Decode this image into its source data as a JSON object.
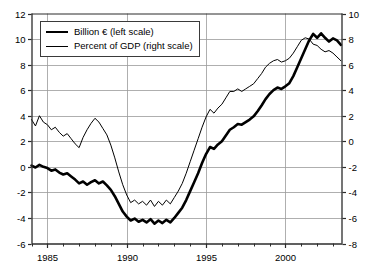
{
  "chart_data": {
    "type": "line",
    "title": "",
    "subtitle": "",
    "xlabel": "",
    "ylabel": "Billion €",
    "y2label": "Percent of GDP",
    "grid": true,
    "legend_position": "top-left",
    "xlim": [
      1984.0,
      2003.6
    ],
    "ylim": [
      -6,
      12
    ],
    "y2lim": [
      -8,
      10
    ],
    "yticks": [
      -6,
      -4,
      -2,
      0,
      2,
      4,
      6,
      8,
      10,
      12
    ],
    "y2ticks": [
      -8,
      -6,
      -4,
      -2,
      0,
      2,
      4,
      6,
      8,
      10
    ],
    "xticks_major": [
      1985,
      1990,
      1995,
      2000
    ],
    "xticks_minor": [
      1984,
      1986,
      1987,
      1988,
      1989,
      1991,
      1992,
      1993,
      1994,
      1996,
      1997,
      1998,
      1999,
      2001,
      2002,
      2003
    ],
    "ytick_labels": [
      "-6",
      "-4",
      "-2",
      "0",
      "2",
      "4",
      "6",
      "8",
      "10",
      "12"
    ],
    "y2tick_labels": [
      "-8",
      "-6",
      "-4",
      "-2",
      "0",
      "2",
      "4",
      "6",
      "8",
      "10"
    ],
    "xtick_labels": [
      "1985",
      "1990",
      "1995",
      "2000"
    ],
    "series": [
      {
        "name": "Billion € (left scale)",
        "axis": "left",
        "style": "thick",
        "color": "#000000",
        "width": 2.6,
        "x": [
          1984.0,
          1984.25,
          1984.5,
          1984.75,
          1985.0,
          1985.25,
          1985.5,
          1985.75,
          1986.0,
          1986.25,
          1986.5,
          1986.75,
          1987.0,
          1987.25,
          1987.5,
          1987.75,
          1988.0,
          1988.25,
          1988.5,
          1988.75,
          1989.0,
          1989.25,
          1989.5,
          1989.75,
          1990.0,
          1990.25,
          1990.5,
          1990.75,
          1991.0,
          1991.25,
          1991.5,
          1991.75,
          1992.0,
          1992.25,
          1992.5,
          1992.75,
          1993.0,
          1993.25,
          1993.5,
          1993.75,
          1994.0,
          1994.25,
          1994.5,
          1994.75,
          1995.0,
          1995.25,
          1995.5,
          1995.75,
          1996.0,
          1996.25,
          1996.5,
          1996.75,
          1997.0,
          1997.25,
          1997.5,
          1997.75,
          1998.0,
          1998.25,
          1998.5,
          1998.75,
          1999.0,
          1999.25,
          1999.5,
          1999.75,
          2000.0,
          2000.25,
          2000.5,
          2000.75,
          2001.0,
          2001.25,
          2001.5,
          2001.75,
          2002.0,
          2002.25,
          2002.5,
          2002.75,
          2003.0,
          2003.25,
          2003.5
        ],
        "values": [
          0.1,
          -0.05,
          0.15,
          0.0,
          -0.1,
          -0.3,
          -0.2,
          -0.45,
          -0.6,
          -0.5,
          -0.75,
          -1.0,
          -1.3,
          -1.15,
          -1.4,
          -1.2,
          -1.05,
          -1.3,
          -1.15,
          -1.45,
          -1.8,
          -2.3,
          -2.9,
          -3.5,
          -3.9,
          -4.2,
          -4.05,
          -4.3,
          -4.15,
          -4.35,
          -4.1,
          -4.45,
          -4.2,
          -4.4,
          -4.15,
          -4.35,
          -4.0,
          -3.6,
          -3.2,
          -2.6,
          -1.9,
          -1.2,
          -0.5,
          0.3,
          1.0,
          1.55,
          1.4,
          1.75,
          2.0,
          2.45,
          2.9,
          3.1,
          3.35,
          3.3,
          3.5,
          3.7,
          3.95,
          4.35,
          4.8,
          5.3,
          5.7,
          6.0,
          6.2,
          6.1,
          6.3,
          6.55,
          7.1,
          7.8,
          8.5,
          9.2,
          9.9,
          10.4,
          10.1,
          10.45,
          10.1,
          9.8,
          10.05,
          9.9,
          9.55
        ]
      },
      {
        "name": "Percent of GDP (right scale)",
        "axis": "right",
        "style": "thin",
        "color": "#000000",
        "width": 1.0,
        "x": [
          1984.0,
          1984.25,
          1984.5,
          1984.75,
          1985.0,
          1985.25,
          1985.5,
          1985.75,
          1986.0,
          1986.25,
          1986.5,
          1986.75,
          1987.0,
          1987.25,
          1987.5,
          1987.75,
          1988.0,
          1988.25,
          1988.5,
          1988.75,
          1989.0,
          1989.25,
          1989.5,
          1989.75,
          1990.0,
          1990.25,
          1990.5,
          1990.75,
          1991.0,
          1991.25,
          1991.5,
          1991.75,
          1992.0,
          1992.25,
          1992.5,
          1992.75,
          1993.0,
          1993.25,
          1993.5,
          1993.75,
          1994.0,
          1994.25,
          1994.5,
          1994.75,
          1995.0,
          1995.25,
          1995.5,
          1995.75,
          1996.0,
          1996.25,
          1996.5,
          1996.75,
          1997.0,
          1997.25,
          1997.5,
          1997.75,
          1998.0,
          1998.25,
          1998.5,
          1998.75,
          1999.0,
          1999.25,
          1999.5,
          1999.75,
          2000.0,
          2000.25,
          2000.5,
          2000.75,
          2001.0,
          2001.25,
          2001.5,
          2001.75,
          2002.0,
          2002.25,
          2002.5,
          2002.75,
          2003.0,
          2003.25,
          2003.5
        ],
        "values": [
          1.7,
          1.2,
          2.0,
          1.5,
          1.3,
          0.9,
          1.1,
          0.7,
          0.4,
          0.6,
          0.2,
          -0.2,
          -0.5,
          0.3,
          0.9,
          1.4,
          1.8,
          1.5,
          1.0,
          0.5,
          -0.3,
          -1.3,
          -2.4,
          -3.4,
          -4.2,
          -4.8,
          -4.6,
          -4.9,
          -4.7,
          -5.0,
          -4.6,
          -5.1,
          -4.7,
          -5.0,
          -4.6,
          -4.9,
          -4.4,
          -3.9,
          -3.3,
          -2.5,
          -1.6,
          -0.7,
          0.2,
          1.1,
          1.9,
          2.5,
          2.2,
          2.6,
          2.9,
          3.4,
          3.9,
          3.9,
          4.1,
          3.9,
          4.1,
          4.3,
          4.5,
          4.9,
          5.3,
          5.8,
          6.1,
          6.3,
          6.4,
          6.2,
          6.3,
          6.5,
          6.9,
          7.4,
          7.9,
          8.1,
          8.0,
          7.6,
          7.5,
          7.2,
          7.0,
          7.1,
          6.9,
          6.6,
          6.3
        ]
      }
    ]
  },
  "legend": {
    "entries": [
      {
        "label": "Billion € (left scale)",
        "style": "thick"
      },
      {
        "label": "Percent of GDP (right scale)",
        "style": "thin"
      }
    ]
  },
  "colors": {
    "axis": "#2b2b2b",
    "grid": "#9a9a9a",
    "line": "#000000",
    "background": "#ffffff"
  }
}
